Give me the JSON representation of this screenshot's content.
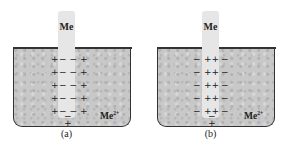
{
  "figure": {
    "panels": [
      {
        "id": "a",
        "caption": "(a)",
        "electrode_label": "Me",
        "ion_label": "Me",
        "ion_charge": "2+",
        "left_signs": [
          "+",
          "+",
          "+",
          "+",
          "+"
        ],
        "electrode_signs": [
          "− −",
          "− −",
          "− −",
          "− −",
          "− −",
          "−"
        ],
        "right_signs": [
          "+",
          "+",
          "+",
          "+",
          "+"
        ],
        "bottom_sign": "+"
      },
      {
        "id": "b",
        "caption": "(b)",
        "electrode_label": "Me",
        "ion_label": "Me",
        "ion_charge": "2+",
        "left_signs": [
          "−",
          "−",
          "−",
          "−",
          "−"
        ],
        "electrode_signs": [
          "++",
          "++",
          "++",
          "++",
          "++",
          "−"
        ],
        "right_signs": [
          "−",
          "−",
          "−",
          "−",
          "−"
        ],
        "bottom_sign": "+"
      }
    ],
    "colors": {
      "solution": "#c8c8c8",
      "electrode": "#e6e6e6",
      "outline": "#333333"
    }
  }
}
